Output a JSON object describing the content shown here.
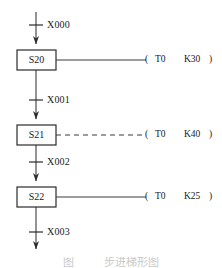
{
  "diagram": {
    "type": "sfc-ladder",
    "line_color": "#3a3a3a",
    "text_color": "#1a1a1a",
    "states": [
      {
        "id": "state-s20",
        "label": "S20",
        "x": 17,
        "y": 50,
        "w": 39,
        "h": 20
      },
      {
        "id": "state-s21",
        "label": "S21",
        "x": 17,
        "y": 125,
        "w": 39,
        "h": 20
      },
      {
        "id": "state-s22",
        "label": "S22",
        "x": 17,
        "y": 187,
        "w": 39,
        "h": 20
      }
    ],
    "transitions": [
      {
        "id": "transition-x000",
        "label": "X000",
        "x": 47,
        "y": 20
      },
      {
        "id": "transition-x001",
        "label": "X001",
        "x": 47,
        "y": 95
      },
      {
        "id": "transition-x002",
        "label": "X002",
        "x": 47,
        "y": 157
      },
      {
        "id": "transition-x003",
        "label": "X003",
        "x": 47,
        "y": 227
      }
    ],
    "outputs": [
      {
        "id": "output-t0-k30",
        "open_paren": "(",
        "device": "T0",
        "preset": "K30",
        "close_paren": ")",
        "line_style": "solid",
        "y": 60
      },
      {
        "id": "output-t0-k40",
        "open_paren": "(",
        "device": "T0",
        "preset": "K40",
        "close_paren": ")",
        "line_style": "dashed",
        "y": 135
      },
      {
        "id": "output-t0-k25",
        "open_paren": "(",
        "device": "T0",
        "preset": "K25",
        "close_paren": ")",
        "line_style": "solid",
        "y": 197
      }
    ],
    "caption": "图           步进梯形图"
  }
}
